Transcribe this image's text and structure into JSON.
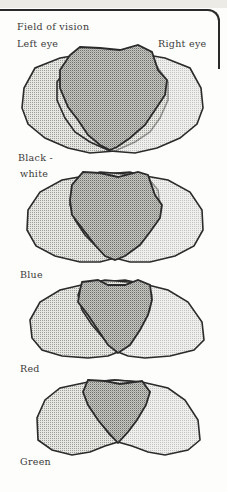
{
  "title": "Field of vision",
  "left_eye_label": "Left eye",
  "right_eye_label": "Right eye",
  "panels": [
    {
      "label": "Black -",
      "label2": "white",
      "name": "black-white"
    },
    {
      "label": "Blue",
      "name": "blue"
    },
    {
      "label": "Red",
      "name": "red"
    },
    {
      "label": "Green",
      "name": "green"
    }
  ],
  "colors": {
    "outline": "#2b2b2b",
    "monocular_fill": "#d9d9d6",
    "binocular_fill": "#b9b9b6",
    "background": "#fdfdfb"
  }
}
